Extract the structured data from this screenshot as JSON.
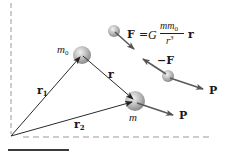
{
  "diagram": {
    "colors": {
      "line": "#2a2a2a",
      "dashed": "#9a9a9a",
      "arrow": "#5a5a5a",
      "sphere_light": "#e6e6e6",
      "sphere_dark": "#8c8c8c",
      "bottom_bar": "#3a3a3a"
    },
    "labels": {
      "m0": {
        "base": "m",
        "sub": "0"
      },
      "m": "m",
      "r": "r",
      "r1": {
        "base": "r",
        "sub": "1"
      },
      "r2": {
        "base": "r",
        "sub": "2"
      },
      "neg_F": "−F",
      "P_upper": "P",
      "P_lower": "P"
    },
    "formula": {
      "lhs": "F",
      "equals": "=",
      "G": "G",
      "numerator": "mm",
      "numerator_sub": "0",
      "denominator": "r",
      "denominator_sup": "3",
      "vector": "r"
    }
  }
}
